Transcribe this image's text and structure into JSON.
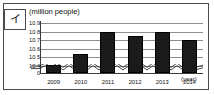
{
  "figure": {
    "panel_label": "イ",
    "units_caption": "(million people)",
    "x_unit_caption": "(year)"
  },
  "chart_data": {
    "type": "bar",
    "title": "",
    "subtitle": "",
    "xlabel": "(year)",
    "ylabel": "(million people)",
    "categories": [
      "2009",
      "2010",
      "2011",
      "2012",
      "2013",
      "2014"
    ],
    "values": [
      10.41,
      10.54,
      10.8,
      10.75,
      10.8,
      10.7
    ],
    "ytick_labels": [
      "10.9",
      "10.8",
      "10.7",
      "10.6",
      "10.5",
      "10.4",
      "0"
    ],
    "ytick_values": [
      10.9,
      10.8,
      10.7,
      10.6,
      10.5,
      10.4,
      0
    ],
    "ylim": [
      10.4,
      10.95
    ],
    "axis_break": true,
    "axis_break_between": [
      0,
      10.4
    ],
    "grid": true,
    "legend": "none",
    "bar_color": "#1b1b1b",
    "grid_color": "#8d8d8d",
    "axis_color": "#3a3a3a"
  }
}
